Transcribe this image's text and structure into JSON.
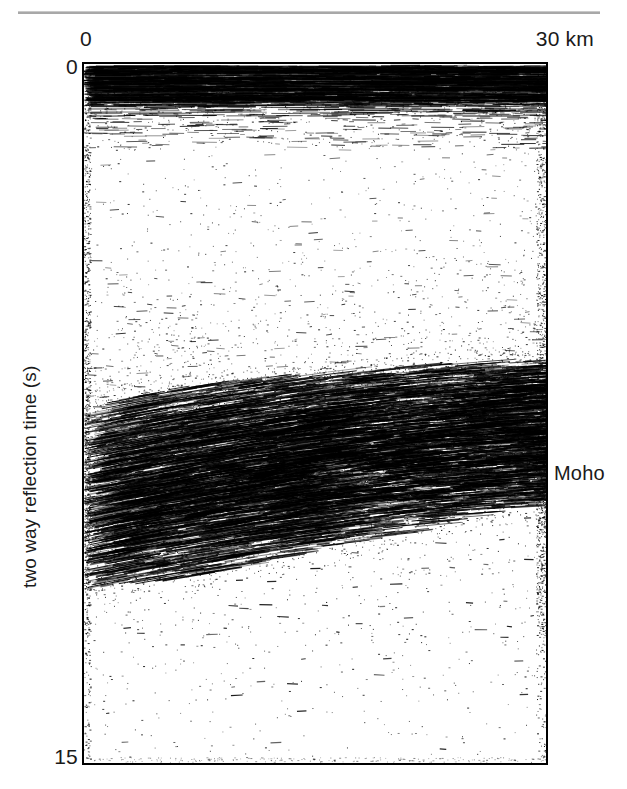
{
  "figure": {
    "type": "seismic-reflection-profile",
    "divider_color": "#a8a8a8",
    "ink_color": "#000000"
  },
  "axes": {
    "x_left_label": "0",
    "x_right_label": "30 km",
    "y_top_label": "0",
    "y_bottom_label": "15",
    "y_axis_title": "two way reflection time (s)"
  },
  "annotations": {
    "moho": "Moho"
  },
  "chart_data": {
    "type": "scatter",
    "title": "",
    "subtitle": "",
    "xlabel": "distance (km)",
    "ylabel": "two way reflection time (s)",
    "xlim": [
      0,
      30
    ],
    "ylim": [
      0,
      15
    ],
    "y_inverted": true,
    "grid": false,
    "legend": null,
    "x_ticks": [
      0,
      30
    ],
    "x_tick_labels": [
      "0",
      "30 km"
    ],
    "y_ticks": [
      0,
      15
    ],
    "y_tick_labels": [
      "0",
      "15"
    ],
    "annotations": [
      {
        "text": "Moho",
        "x": 30,
        "y": 9.0,
        "placement": "outside-right",
        "points_to": "base of lower-crustal reflective band at right edge"
      }
    ],
    "series": [
      {
        "name": "near-surface sedimentary reflectors",
        "kind": "dense-horizontal-reflectors",
        "time_range_s": [
          0.05,
          1.6
        ],
        "depth_band_px": [
          64,
          100
        ],
        "density": 0.92,
        "dip_deg": 0.5,
        "segment_length_px": [
          18,
          95
        ],
        "description": "strong continuous sub-horizontal layering immediately below datum"
      },
      {
        "name": "upper-crust transparent zone",
        "kind": "sparse-speckle",
        "time_range_s": [
          1.6,
          6.0
        ],
        "depth_band_px": [
          100,
          345
        ],
        "density": 0.18,
        "dip_deg": 0,
        "segment_length_px": [
          1,
          7
        ],
        "description": "relatively reflection-free upper crust, scattered incoherent noise"
      },
      {
        "name": "lower-crust reflective band",
        "kind": "dipping-reflector-fabric",
        "time_range_s": [
          6.3,
          11.0
        ],
        "depth_band_px": [
          355,
          540
        ],
        "density": 0.78,
        "dip_deg": -9,
        "segment_length_px": [
          10,
          70
        ],
        "description": "laminated lower crust; reflectors shallow toward the right, band thins and rises eastward"
      },
      {
        "name": "sub-Moho mantle",
        "kind": "sparse-speckle",
        "time_range_s": [
          11.2,
          15.0
        ],
        "depth_band_px": [
          545,
          763
        ],
        "density": 0.08,
        "dip_deg": 0,
        "segment_length_px": [
          1,
          6
        ],
        "description": "non-reflective upper mantle below the Moho"
      },
      {
        "name": "right-edge noise column",
        "kind": "edge-noise",
        "time_range_s": [
          0.3,
          12.0
        ],
        "depth_band_px": [
          70,
          600
        ],
        "density": 0.35,
        "dip_deg": 0,
        "segment_length_px": [
          1,
          9
        ],
        "description": "elevated incoherent amplitude along the eastern trace edge"
      }
    ],
    "moho_horizon": {
      "name": "Moho (base of reflective lower crust)",
      "x_km": [
        0,
        5,
        10,
        15,
        20,
        25,
        30
      ],
      "two_way_time_s": [
        11.3,
        11.1,
        10.8,
        10.4,
        10.1,
        9.7,
        9.4
      ]
    },
    "reflective_band_top": {
      "name": "top of lower-crustal reflectivity",
      "x_km": [
        0,
        5,
        10,
        15,
        20,
        25,
        30
      ],
      "two_way_time_s": [
        7.3,
        7.0,
        6.8,
        6.6,
        6.5,
        6.4,
        6.3
      ]
    }
  }
}
